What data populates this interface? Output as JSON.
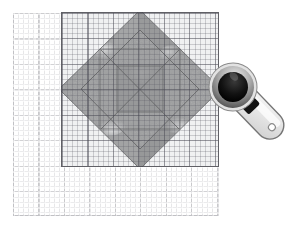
{
  "scene": {
    "title": "Quilting rotary cutter, acrylic ruler and cutting mat with square-in-a-square quilt block",
    "width": 303,
    "height": 236,
    "background_color": "#ffffff"
  },
  "cutting_mat": {
    "name": "Self-healing cutting mat",
    "surface_color": "#ffffff",
    "major_grid_color": "#6e6e76",
    "minor_grid_color": "#96969e",
    "major_grid_spacing_px": 25.5,
    "minor_grid_spacing_px": 5.1,
    "left": 13,
    "top": 13,
    "width": 206,
    "height": 203
  },
  "acrylic_ruler": {
    "name": "Transparent acrylic quilting ruler",
    "border_color": "#46464e",
    "tint_color": "#bec3cd",
    "grid_color": "#46465a",
    "left": 61,
    "top": 12,
    "width": 158,
    "height": 155
  },
  "quilt_block": {
    "name": "Square-in-a-square quilt block",
    "colors": {
      "background_light": "#f2f2f2",
      "diamond_mid_gray": "#9a9a9a",
      "diamond_dark_gray": "#8e8e8e",
      "inner_square_gray": "#959595",
      "center_gray": "#8b8b8b",
      "highlight_white": "#f7f7f7",
      "seam_line": "#6a6a6a"
    },
    "pieces": [
      {
        "label": "outer diamond",
        "shape": "rotated-square",
        "fill": "#9a9a9a"
      },
      {
        "label": "corner triangle top-left",
        "shape": "triangle",
        "fill": "#f2f2f2"
      },
      {
        "label": "corner triangle top-right",
        "shape": "triangle",
        "fill": "#f2f2f2"
      },
      {
        "label": "corner triangle bottom-left",
        "shape": "triangle",
        "fill": "#f2f2f2"
      },
      {
        "label": "corner triangle bottom-right",
        "shape": "triangle",
        "fill": "#f2f2f2"
      },
      {
        "label": "inner square",
        "shape": "square",
        "fill": "#959595"
      },
      {
        "label": "center square",
        "shape": "square",
        "fill": "#8b8b8b"
      }
    ]
  },
  "rotary_cutter": {
    "name": "Rotary cutter",
    "blade_hub_color": "#111111",
    "blade_ring_color": "#6e6e6e",
    "blade_rim_color": "#d8d8d8",
    "handle_color": "#e8e8e8",
    "handle_edge_color": "#6e6e6e",
    "switch_color": "#141414",
    "hole_color": "#ffffff",
    "left": 206,
    "top": 60,
    "width": 97,
    "height": 100,
    "rotation_deg": 46
  }
}
